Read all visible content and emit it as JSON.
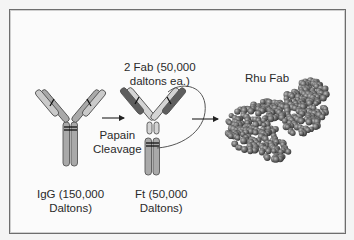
{
  "diagram": {
    "labels": {
      "fab_pair_line1": "2 Fab (50,000",
      "fab_pair_line2": "daltons ea.)",
      "rhu_fab": "Rhu Fab",
      "papain_line1": "Papain",
      "papain_line2": "Cleavage",
      "igg_line1": "IgG (150,000",
      "igg_line2": "Daltons)",
      "ft_line1": "Ft (50,000",
      "ft_line2": "Daltons)"
    },
    "nodes": [
      {
        "id": "igg",
        "label": "IgG (150,000 Daltons)",
        "shape": "Y antibody"
      },
      {
        "id": "cleaved",
        "label": "2 Fab (50,000 daltons ea.) + Ft (50,000 Daltons)",
        "shape": "cleaved antibody"
      },
      {
        "id": "rhu_fab",
        "label": "Rhu Fab",
        "shape": "space-filling molecular model"
      }
    ],
    "edges": [
      {
        "from": "igg",
        "to": "cleaved",
        "label": "Papain Cleavage"
      },
      {
        "from": "cleaved",
        "to": "rhu_fab",
        "label": ""
      }
    ],
    "colors": {
      "chain_light": "#c9c9c9",
      "chain_mid": "#a8a8a8",
      "chain_dark": "#5e5e5e",
      "outline": "#555555",
      "frame_border": "#6d6d6d",
      "molecule": "#6f6f6f"
    }
  }
}
